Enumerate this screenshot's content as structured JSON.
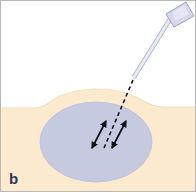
{
  "figure": {
    "panel_label": "b",
    "caption_label_color": "#2c3560",
    "border_color": "#b9b9b9",
    "background_color": "#ffffff"
  },
  "scene": {
    "title": "Needle insertion into subcutaneous tissue with fanning movement",
    "air_region": {
      "name": "background-air",
      "color": "#ffffff"
    },
    "skin_region": {
      "name": "skin-tissue",
      "color": "#fbeacd",
      "edge_color": "#f3dfbe",
      "surface_top_y": 106,
      "bump_peak_y": 92
    },
    "infiltration_bleb": {
      "name": "anesthetic-bleb",
      "color": "#c6cae1",
      "edge_color": "#b9bed9",
      "center_x": 96,
      "center_y": 142,
      "radius_x": 56,
      "radius_y": 40
    },
    "needle": {
      "name": "needle",
      "hub_color": "#d4d8ea",
      "hub_edge_color": "#9aa1c0",
      "shaft_color": "#e8eaf3",
      "shaft_edge_color": "#a9aec6",
      "hub_tip_x": 177,
      "hub_tip_y": 7,
      "tip_x": 133,
      "tip_y": 78,
      "angle_label": ""
    },
    "trajectory": {
      "name": "needle-trajectory-dashed",
      "color": "#1a1a1a",
      "dash": "4 3",
      "start_x": 133,
      "start_y": 80,
      "end_x": 104,
      "end_y": 148
    },
    "arrows": [
      {
        "name": "fanning-arrow-left",
        "color": "#111111",
        "x1": 92,
        "y1": 148,
        "x2": 106,
        "y2": 121,
        "double_headed": true
      },
      {
        "name": "fanning-arrow-right",
        "color": "#111111",
        "x1": 112,
        "y1": 148,
        "x2": 126,
        "y2": 121,
        "double_headed": true
      }
    ]
  }
}
